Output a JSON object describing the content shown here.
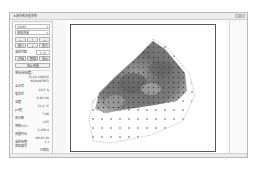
{
  "window": {
    "title": "土壤参数测量系统",
    "controls_label": "关闭"
  },
  "panel": {
    "port_select": "COM3",
    "mode_select": "网格测量",
    "nav_buttons": [
      "←",
      "↑",
      "→"
    ],
    "nav_buttons_row2": [
      "缩小",
      "↓",
      "放大"
    ],
    "grid_label": "采样间距",
    "grid_value": "5 m",
    "toggle_buttons": [
      "开始",
      "暂停",
      "停止"
    ],
    "action_button": "停止测量",
    "coords_header": "坐标(经纬度)",
    "lon": "E116.338815",
    "lat": "N39.987651",
    "readings": [
      {
        "label": "含水率",
        "value": "18.5 %"
      },
      {
        "label": "电导率",
        "value": "0.92 mS"
      },
      {
        "label": "温度",
        "value": "21.4 °C"
      },
      {
        "label": "pH值",
        "value": "7.06"
      },
      {
        "label": "测点数",
        "value": "255"
      },
      {
        "label": "面积(m²)",
        "value": "2,456.4"
      },
      {
        "label": "测量时长",
        "value": "00:45:18"
      },
      {
        "label": "采样周期",
        "value": "1 s"
      },
      {
        "label": "测区编号",
        "value": "A-03"
      }
    ],
    "status_text": "已保存",
    "bottom_button": "导出"
  },
  "plot": {
    "type": "heatmap",
    "description": "Grayscale interpolated contour map of measured field with sample point markers and dotted boundary",
    "colors": {
      "dark": "#555555",
      "mid": "#8a8a8a",
      "light": "#c4c4c4",
      "marker": "#333333",
      "frame": "#555555"
    }
  }
}
